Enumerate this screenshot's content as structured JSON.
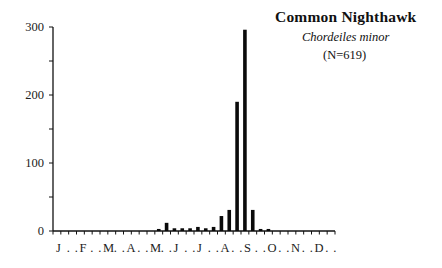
{
  "title": "Common  Nighthawk",
  "subtitle": "Chordeiles minor",
  "n_label": "(N=619)",
  "chart_data": {
    "type": "bar",
    "title": "Common Nighthawk",
    "subtitle": "Chordeiles minor",
    "annotation": "(N=619)",
    "xlabel": "",
    "ylabel": "",
    "ylim": [
      0,
      300
    ],
    "yticks": [
      0,
      100,
      200,
      300
    ],
    "grid": false,
    "legend": null,
    "bin_description": "36 ten-day periods (3 per month, Jan-Dec)",
    "month_labels": [
      "J",
      "F",
      "M",
      "A",
      "M",
      "J",
      "J",
      "A",
      "S",
      "O",
      "N",
      "D"
    ],
    "categories": [
      "Jan1",
      "Jan2",
      "Jan3",
      "Feb1",
      "Feb2",
      "Feb3",
      "Mar1",
      "Mar2",
      "Mar3",
      "Apr1",
      "Apr2",
      "Apr3",
      "May1",
      "May2",
      "May3",
      "Jun1",
      "Jun2",
      "Jun3",
      "Jul1",
      "Jul2",
      "Jul3",
      "Aug1",
      "Aug2",
      "Aug3",
      "Sep1",
      "Sep2",
      "Sep3",
      "Oct1",
      "Oct2",
      "Oct3",
      "Nov1",
      "Nov2",
      "Nov3",
      "Dec1",
      "Dec2",
      "Dec3"
    ],
    "values": [
      0,
      0,
      0,
      0,
      0,
      0,
      0,
      0,
      0,
      0,
      0,
      0,
      0,
      3,
      12,
      4,
      4,
      4,
      6,
      4,
      6,
      22,
      31,
      190,
      296,
      31,
      3,
      3,
      0,
      0,
      0,
      0,
      0,
      0,
      0,
      0
    ]
  }
}
